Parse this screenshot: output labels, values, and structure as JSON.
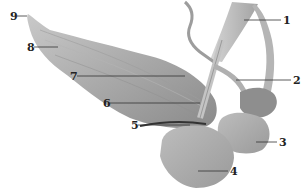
{
  "figure": {
    "type": "anatomical specimen photograph",
    "background": "#ffffff",
    "labels": [
      {
        "id": "1",
        "text": "1",
        "x": 283,
        "y": 15
      },
      {
        "id": "2",
        "text": "2",
        "x": 293,
        "y": 75
      },
      {
        "id": "3",
        "text": "3",
        "x": 279,
        "y": 137
      },
      {
        "id": "4",
        "text": "4",
        "x": 230,
        "y": 166
      },
      {
        "id": "5",
        "text": "5",
        "x": 131,
        "y": 120
      },
      {
        "id": "6",
        "text": "6",
        "x": 103,
        "y": 98
      },
      {
        "id": "7",
        "text": "7",
        "x": 70,
        "y": 71
      },
      {
        "id": "8",
        "text": "8",
        "x": 27,
        "y": 42
      },
      {
        "id": "9",
        "text": "9",
        "x": 10,
        "y": 11
      }
    ]
  }
}
